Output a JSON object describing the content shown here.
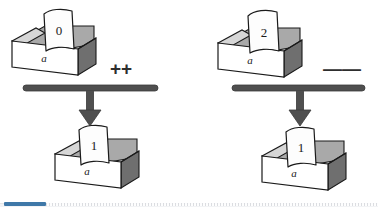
{
  "figure": {
    "colors": {
      "ink": "#1a1a1a",
      "box_front": "#ffffff",
      "box_side_dark": "#6e6e6e",
      "box_inner_shade": "#a8a8a8",
      "box_top_rim": "#d0d0d0",
      "paper": "#fdfdfd",
      "bar": "#4f4f4f",
      "arrow": "#4f4f4f",
      "accent": "#3f78a8"
    },
    "panels": [
      {
        "id": "left",
        "operator": "++",
        "operator_name": "increment-operator",
        "source": {
          "box_label": "a",
          "paper_value": "0"
        },
        "result": {
          "box_label": "a",
          "paper_value": "1"
        }
      },
      {
        "id": "right",
        "operator": "——",
        "operator_name": "decrement-operator",
        "source": {
          "box_label": "a",
          "paper_value": "2"
        },
        "result": {
          "box_label": "a",
          "paper_value": "1"
        }
      }
    ]
  },
  "scrollbar": {
    "orientation": "horizontal",
    "thumb_position": "start"
  }
}
